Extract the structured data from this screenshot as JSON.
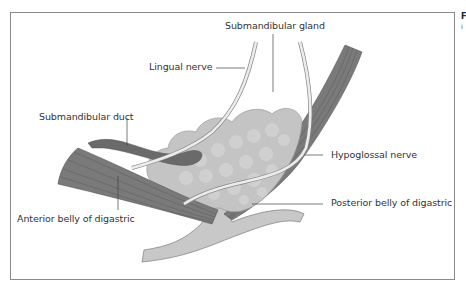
{
  "figure": {
    "labels": {
      "submandibular_gland": "Submandibular gland",
      "lingual_nerve": "Lingual nerve",
      "submandibular_duct": "Submandibular duct",
      "hypoglossal_nerve": "Hypoglossal nerve",
      "posterior_belly": "Posterior belly of digastric",
      "anterior_belly": "Anterior belly of digastric"
    },
    "side_text": {
      "line1": "F",
      "line2": "i"
    },
    "colors": {
      "muscle": "#7a7a7a",
      "muscle_stripe": "#5a5a5a",
      "gland": "#c4c4c4",
      "nerve": "#ececec",
      "duct": "#6a6a6a",
      "bone": "#c8c8c8",
      "leader_line": "#444444",
      "frame": "#8a8a8a"
    }
  }
}
